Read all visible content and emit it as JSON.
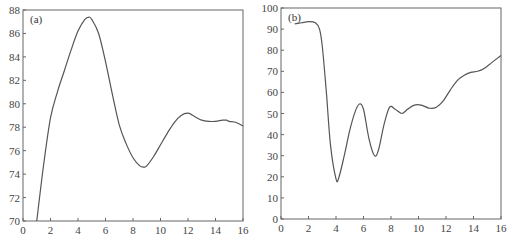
{
  "chart_data": [
    {
      "type": "line",
      "panel_label": "(a)",
      "title": "",
      "xlabel": "",
      "ylabel": "",
      "xlim": [
        0,
        16
      ],
      "ylim": [
        70,
        88
      ],
      "x_ticks": [
        0,
        2,
        4,
        6,
        8,
        10,
        12,
        14,
        16
      ],
      "y_ticks": [
        70,
        72,
        74,
        76,
        78,
        80,
        82,
        84,
        86,
        88
      ],
      "grid": false,
      "legend": null,
      "series": [
        {
          "name": "curve-a",
          "x": [
            1.0,
            1.5,
            2.0,
            2.5,
            3.0,
            3.5,
            4.0,
            4.5,
            4.8,
            5.0,
            5.5,
            6.0,
            6.5,
            7.0,
            7.5,
            8.0,
            8.5,
            8.8,
            9.0,
            9.5,
            10.0,
            10.5,
            11.0,
            11.5,
            12.0,
            12.5,
            13.0,
            13.5,
            14.0,
            14.5,
            14.8,
            15.0,
            15.5,
            16.0
          ],
          "values": [
            70.0,
            74.8,
            78.8,
            81.0,
            82.8,
            84.6,
            86.2,
            87.2,
            87.4,
            87.2,
            86.0,
            83.6,
            80.8,
            78.2,
            76.6,
            75.4,
            74.7,
            74.6,
            74.7,
            75.5,
            76.5,
            77.5,
            78.4,
            79.0,
            79.2,
            78.9,
            78.6,
            78.5,
            78.5,
            78.6,
            78.6,
            78.5,
            78.4,
            78.1
          ]
        }
      ]
    },
    {
      "type": "line",
      "panel_label": "(b)",
      "title": "",
      "xlabel": "",
      "ylabel": "",
      "xlim": [
        0,
        16
      ],
      "ylim": [
        0,
        100
      ],
      "x_ticks": [
        0,
        2,
        4,
        6,
        8,
        10,
        12,
        14,
        16
      ],
      "y_ticks": [
        0,
        10,
        20,
        30,
        40,
        50,
        60,
        70,
        80,
        90,
        100
      ],
      "grid": false,
      "legend": null,
      "series": [
        {
          "name": "curve-b",
          "x": [
            1.0,
            1.5,
            2.0,
            2.5,
            2.8,
            3.0,
            3.3,
            3.6,
            4.0,
            4.2,
            4.6,
            5.0,
            5.4,
            5.7,
            6.0,
            6.4,
            6.8,
            7.1,
            7.5,
            7.9,
            8.3,
            8.8,
            9.2,
            9.7,
            10.2,
            10.8,
            11.3,
            11.8,
            12.3,
            12.8,
            13.3,
            13.8,
            14.3,
            14.8,
            15.3,
            16.0
          ],
          "values": [
            92.5,
            93.0,
            93.5,
            93.0,
            90.0,
            82.0,
            60.0,
            35.0,
            19.0,
            19.5,
            30.0,
            42.0,
            51.0,
            54.5,
            52.0,
            38.0,
            30.0,
            33.0,
            45.0,
            53.0,
            52.0,
            50.0,
            52.0,
            54.0,
            54.0,
            52.5,
            53.0,
            56.0,
            61.0,
            65.5,
            68.0,
            69.5,
            70.0,
            71.5,
            74.0,
            77.5
          ]
        }
      ]
    }
  ]
}
